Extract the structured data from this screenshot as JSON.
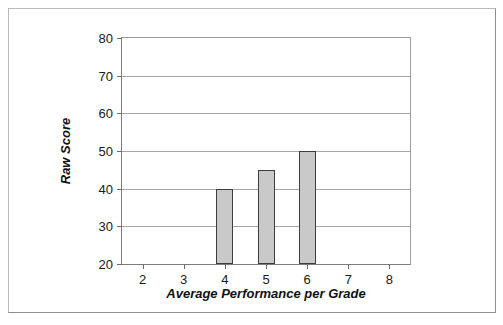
{
  "chart_data": {
    "type": "bar",
    "title": "",
    "subtitle": "",
    "xlabel": "Average Performance per Grade",
    "ylabel": "Raw Score",
    "categories": [
      "2",
      "3",
      "4",
      "5",
      "6",
      "7",
      "8"
    ],
    "values": [
      null,
      null,
      40,
      45,
      50,
      null,
      null
    ],
    "series": [
      {
        "name": "Raw Score",
        "values": [
          null,
          null,
          40,
          45,
          50,
          null,
          null
        ]
      }
    ],
    "ylim": [
      20,
      80
    ],
    "yticks": [
      "20",
      "30",
      "40",
      "50",
      "60",
      "70",
      "80"
    ],
    "ytick_values": [
      20,
      30,
      40,
      50,
      60,
      70,
      80
    ],
    "grid": "horizontal",
    "legend": "none",
    "bar_fill_color": "#c9c9c9",
    "bar_border_color": "#3d3d3d",
    "gridline_color": "#a6a6a6",
    "axis_color": "#7d7d7d",
    "plot_background": "#ffffff",
    "frame_border_color": "#b9b9b9"
  }
}
